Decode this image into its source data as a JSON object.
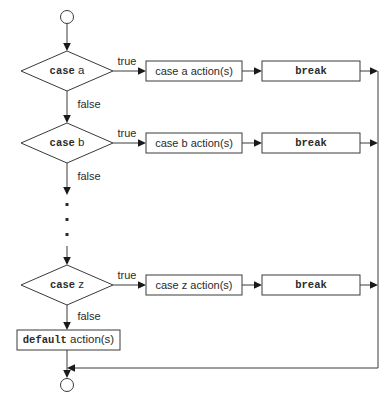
{
  "diagram": {
    "type": "flowchart",
    "start_node": "start-terminator",
    "end_node": "end-terminator",
    "colors": {
      "stroke": "#3a3a3a",
      "text": "#2b2b2b",
      "arrow": "#1a1a1a",
      "background": "#ffffff"
    },
    "edge_labels": {
      "true": "true",
      "false": "false"
    },
    "ellipsis": "⋮",
    "rows": [
      {
        "id": "case-a",
        "condition_keyword": "case",
        "condition_value": "a",
        "true_label": "true",
        "false_label": "false",
        "action_label": "case a action(s)",
        "break_label": "break"
      },
      {
        "id": "case-b",
        "condition_keyword": "case",
        "condition_value": "b",
        "true_label": "true",
        "false_label": "false",
        "action_label": "case b action(s)",
        "break_label": "break"
      },
      {
        "id": "case-z",
        "condition_keyword": "case",
        "condition_value": "z",
        "true_label": "true",
        "false_label": "false",
        "action_label": "case z action(s)",
        "break_label": "break"
      }
    ],
    "default_branch": {
      "id": "default-action",
      "keyword": "default",
      "text": " action(s)"
    }
  }
}
